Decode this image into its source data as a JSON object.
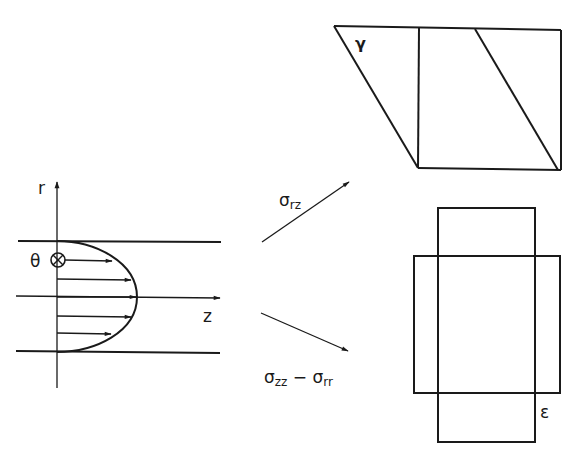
{
  "figure": {
    "colors": {
      "ink": "#1a1a1a",
      "background": "#ffffff"
    }
  },
  "flow_panel": {
    "axis_r_label": "r",
    "axis_z_label": "z",
    "theta_label": "θ",
    "theta_symbol": "⊗",
    "velocity_arrows_count": 5
  },
  "arrows": {
    "shear_label_base": "σ",
    "shear_label_sub": "rz",
    "normal_label_base1": "σ",
    "normal_label_sub1": "zz",
    "normal_label_minus": " − ",
    "normal_label_base2": "σ",
    "normal_label_sub2": "rr"
  },
  "shear_panel": {
    "label": "γ"
  },
  "extension_panel": {
    "label": "ε"
  }
}
